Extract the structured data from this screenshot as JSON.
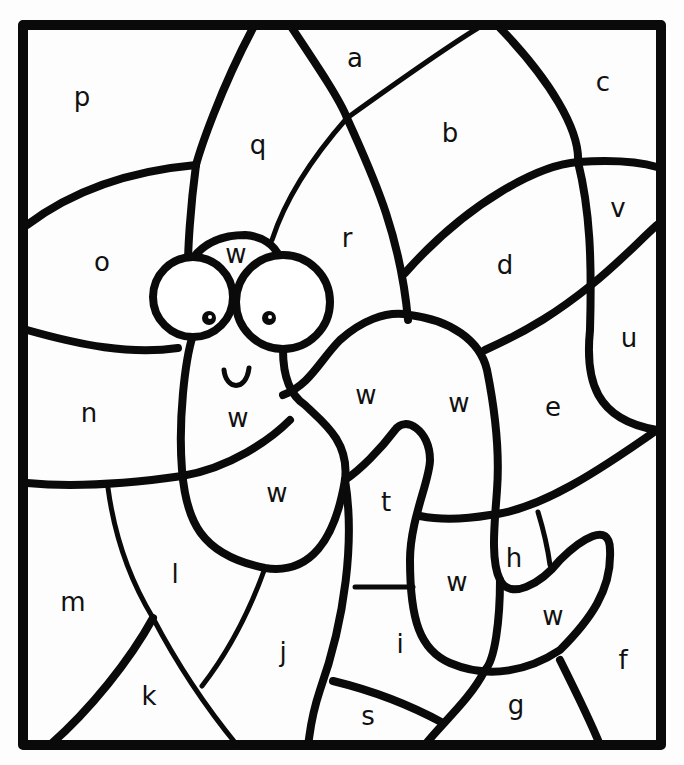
{
  "page": {
    "title_partial": "",
    "background": "#ffffff",
    "line_color": "#0a0a0a"
  },
  "regions": [
    {
      "id": "a",
      "label": "a",
      "x": 355,
      "y": 58
    },
    {
      "id": "b",
      "label": "b",
      "x": 450,
      "y": 133
    },
    {
      "id": "c",
      "label": "c",
      "x": 603,
      "y": 82
    },
    {
      "id": "d",
      "label": "d",
      "x": 505,
      "y": 265
    },
    {
      "id": "e",
      "label": "e",
      "x": 553,
      "y": 407
    },
    {
      "id": "f",
      "label": "f",
      "x": 623,
      "y": 660
    },
    {
      "id": "g",
      "label": "g",
      "x": 516,
      "y": 705
    },
    {
      "id": "h",
      "label": "h",
      "x": 514,
      "y": 558
    },
    {
      "id": "i",
      "label": "i",
      "x": 400,
      "y": 644
    },
    {
      "id": "j",
      "label": "j",
      "x": 283,
      "y": 652
    },
    {
      "id": "k",
      "label": "k",
      "x": 149,
      "y": 696
    },
    {
      "id": "l",
      "label": "l",
      "x": 175,
      "y": 574
    },
    {
      "id": "m",
      "label": "m",
      "x": 73,
      "y": 602
    },
    {
      "id": "n",
      "label": "n",
      "x": 89,
      "y": 413
    },
    {
      "id": "o",
      "label": "o",
      "x": 102,
      "y": 262
    },
    {
      "id": "p",
      "label": "p",
      "x": 82,
      "y": 97
    },
    {
      "id": "q",
      "label": "q",
      "x": 258,
      "y": 145
    },
    {
      "id": "r",
      "label": "r",
      "x": 347,
      "y": 238
    },
    {
      "id": "s",
      "label": "s",
      "x": 368,
      "y": 716
    },
    {
      "id": "t",
      "label": "t",
      "x": 386,
      "y": 502
    },
    {
      "id": "u",
      "label": "u",
      "x": 629,
      "y": 338
    },
    {
      "id": "v",
      "label": "v",
      "x": 618,
      "y": 208
    },
    {
      "id": "w1",
      "label": "w",
      "x": 236,
      "y": 254
    },
    {
      "id": "w2",
      "label": "w",
      "x": 238,
      "y": 418
    },
    {
      "id": "w3",
      "label": "w",
      "x": 277,
      "y": 493
    },
    {
      "id": "w4",
      "label": "w",
      "x": 366,
      "y": 395
    },
    {
      "id": "w5",
      "label": "w",
      "x": 459,
      "y": 403
    },
    {
      "id": "w6",
      "label": "w",
      "x": 457,
      "y": 582
    },
    {
      "id": "w7",
      "label": "w",
      "x": 553,
      "y": 616
    }
  ],
  "face": {
    "mouth_glyph": "U"
  }
}
